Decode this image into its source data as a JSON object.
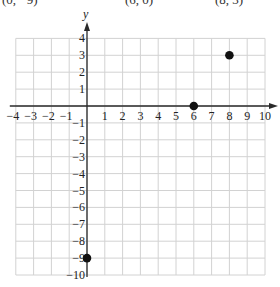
{
  "header_clipped": {
    "labels": [
      "(0, −9)",
      "(6, 0)",
      "(8, 3)"
    ]
  },
  "chart_data": {
    "type": "scatter",
    "title": "",
    "xlabel": "",
    "ylabel": "y",
    "xlim": [
      -4,
      10
    ],
    "ylim": [
      -10,
      4
    ],
    "grid": true,
    "x_ticks": [
      -4,
      -3,
      -2,
      -1,
      1,
      2,
      3,
      4,
      5,
      6,
      7,
      8,
      9,
      10
    ],
    "y_ticks": [
      4,
      3,
      2,
      1,
      -1,
      -2,
      -3,
      -4,
      -5,
      -6,
      -7,
      -8,
      -9,
      -10
    ],
    "series": [
      {
        "name": "points",
        "points": [
          {
            "x": 0,
            "y": -9
          },
          {
            "x": 6,
            "y": 0
          },
          {
            "x": 8,
            "y": 3
          }
        ]
      }
    ]
  },
  "layout": {
    "origin_px": [
      87,
      106
    ],
    "unit_x_px": 17.8,
    "unit_y_px": 16.9,
    "colors": {
      "grid": "#d2d2d2",
      "axis": "#2a2a2a",
      "point": "#111111"
    }
  }
}
